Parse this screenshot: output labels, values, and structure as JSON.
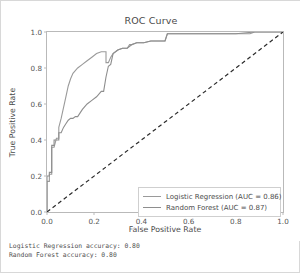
{
  "chart_data": {
    "type": "line",
    "title": "ROC Curve",
    "xlabel": "False Positive Rate",
    "ylabel": "True Positive Rate",
    "xlim": [
      0.0,
      1.0
    ],
    "ylim": [
      0.0,
      1.0
    ],
    "grid": false,
    "legend_position": "lower right",
    "xticks": [
      "0.0",
      "0.2",
      "0.4",
      "0.6",
      "0.8",
      "1.0"
    ],
    "xtick_values": [
      0.0,
      0.2,
      0.4,
      0.6,
      0.8,
      1.0
    ],
    "yticks": [
      "0.0",
      "0.2",
      "0.4",
      "0.6",
      "0.8",
      "1.0"
    ],
    "ytick_values": [
      0.0,
      0.2,
      0.4,
      0.6,
      0.8,
      1.0
    ],
    "series": [
      {
        "name": "Logistic Regression (AUC = 0.86)",
        "model": "Logistic Regression",
        "auc": 0.86,
        "color": "#9a9a9a",
        "linestyle": "solid",
        "x": [
          0.0,
          0.0,
          0.01,
          0.01,
          0.02,
          0.02,
          0.03,
          0.04,
          0.05,
          0.05,
          0.06,
          0.07,
          0.08,
          0.09,
          0.1,
          0.11,
          0.13,
          0.15,
          0.17,
          0.19,
          0.21,
          0.23,
          0.25,
          0.25,
          0.26,
          0.27,
          0.28,
          0.3,
          0.32,
          0.34,
          0.35,
          0.36,
          0.38,
          0.41,
          0.44,
          0.47,
          0.5,
          0.51,
          0.52,
          0.62,
          0.74,
          0.86,
          0.88,
          1.0
        ],
        "y": [
          0.0,
          0.17,
          0.17,
          0.21,
          0.21,
          0.36,
          0.36,
          0.41,
          0.41,
          0.47,
          0.52,
          0.58,
          0.64,
          0.7,
          0.74,
          0.77,
          0.8,
          0.82,
          0.84,
          0.86,
          0.88,
          0.89,
          0.89,
          0.83,
          0.83,
          0.86,
          0.88,
          0.9,
          0.91,
          0.91,
          0.93,
          0.93,
          0.94,
          0.94,
          0.95,
          0.95,
          0.95,
          0.99,
          0.99,
          0.99,
          0.99,
          0.99,
          1.0,
          1.0
        ]
      },
      {
        "name": "Random Forest (AUC = 0.87)",
        "model": "Random Forest",
        "auc": 0.87,
        "color": "#8e8e8e",
        "linestyle": "solid",
        "x": [
          0.0,
          0.0,
          0.01,
          0.01,
          0.02,
          0.02,
          0.03,
          0.03,
          0.04,
          0.05,
          0.05,
          0.06,
          0.07,
          0.08,
          0.09,
          0.1,
          0.11,
          0.12,
          0.13,
          0.15,
          0.17,
          0.19,
          0.21,
          0.23,
          0.24,
          0.25,
          0.26,
          0.27,
          0.28,
          0.3,
          0.32,
          0.34,
          0.36,
          0.38,
          0.41,
          0.44,
          0.47,
          0.5,
          0.51,
          0.6,
          0.7,
          0.8,
          0.88,
          1.0
        ],
        "y": [
          0.0,
          0.2,
          0.2,
          0.22,
          0.22,
          0.37,
          0.37,
          0.4,
          0.4,
          0.4,
          0.44,
          0.44,
          0.47,
          0.49,
          0.51,
          0.52,
          0.52,
          0.53,
          0.53,
          0.57,
          0.6,
          0.62,
          0.64,
          0.67,
          0.67,
          0.75,
          0.81,
          0.82,
          0.88,
          0.9,
          0.91,
          0.91,
          0.93,
          0.94,
          0.94,
          0.95,
          0.95,
          0.95,
          0.99,
          0.99,
          0.99,
          0.99,
          1.0,
          1.0
        ]
      },
      {
        "name": "chance-diagonal",
        "model": "Chance",
        "auc": 0.5,
        "color": "#2b2b2b",
        "linestyle": "dashed",
        "x": [
          0.0,
          1.0
        ],
        "y": [
          0.0,
          1.0
        ]
      }
    ]
  },
  "legend": {
    "items": [
      {
        "label": "Logistic Regression (AUC = 0.86)",
        "color": "#9a9a9a"
      },
      {
        "label": "Random Forest (AUC = 0.87)",
        "color": "#8e8e8e"
      }
    ]
  },
  "footer": {
    "line1": "Logistic Regression accuracy: 0.80",
    "line2": "Random Forest accuracy: 0.80"
  }
}
